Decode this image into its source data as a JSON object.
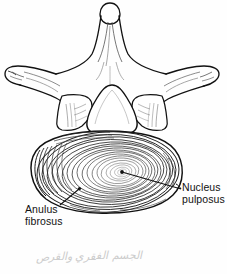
{
  "figure": {
    "ink_color": "#111111",
    "background_color": "#ffffff",
    "line_shading_color": "#555555"
  },
  "labels": {
    "anulus": {
      "line1": "Anulus",
      "line2": "fibrosus",
      "leader_from_x": 60,
      "leader_from_y": 204,
      "leader_to_x": 79,
      "leader_to_y": 188
    },
    "nucleus": {
      "line1": "Nucleus",
      "line2": "pulposus",
      "leader_from_x": 181,
      "leader_from_y": 188,
      "leader_to_x": 122,
      "leader_to_y": 172
    }
  },
  "anatomy": {
    "spinous_process": "spinous-process",
    "transverse_process_left": "transverse-process-left",
    "transverse_process_right": "transverse-process-right",
    "superior_articular_left": "superior-articular-process-left",
    "superior_articular_right": "superior-articular-process-right",
    "vertebral_foramen": "vertebral-foramen",
    "pedicle_left": "pedicle-left",
    "pedicle_right": "pedicle-right",
    "vertebral_body_disc": "intervertebral-disc",
    "anulus_rings_count": 16,
    "nucleus_center_x": 122,
    "nucleus_center_y": 172
  },
  "annotation": {
    "handwriting": "الجسم الفقري والقرص"
  }
}
